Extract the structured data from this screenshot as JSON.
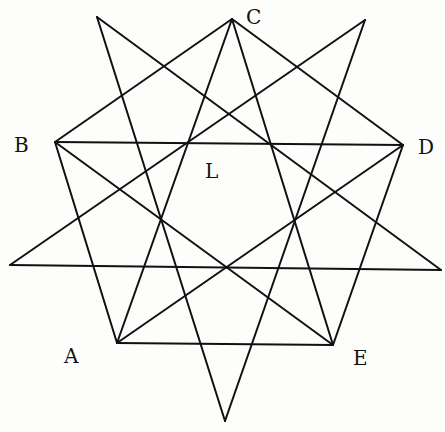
{
  "figure": {
    "labels": {
      "A": "A",
      "B": "B",
      "C": "C",
      "D": "D",
      "E": "E",
      "L": "L"
    },
    "pentagon_vertices": {
      "A": [
        117,
        343
      ],
      "B": [
        55,
        142
      ],
      "C": [
        232,
        19
      ],
      "D": [
        403,
        145
      ],
      "E": [
        333,
        345
      ]
    },
    "star_tips": {
      "top_left": [
        97,
        17
      ],
      "top_right": [
        365,
        20
      ],
      "right": [
        441,
        270
      ],
      "bottom": [
        225,
        421
      ],
      "left": [
        10,
        265
      ]
    },
    "pentagon_edges": [
      [
        "A",
        "B"
      ],
      [
        "B",
        "C"
      ],
      [
        "C",
        "D"
      ],
      [
        "D",
        "E"
      ],
      [
        "E",
        "A"
      ]
    ],
    "pentagon_diagonals": [
      [
        "A",
        "C"
      ],
      [
        "A",
        "D"
      ],
      [
        "B",
        "D"
      ],
      [
        "B",
        "E"
      ],
      [
        "C",
        "E"
      ]
    ],
    "star_edges": [
      [
        "top_left",
        "right"
      ],
      [
        "right",
        "left"
      ],
      [
        "left",
        "top_right"
      ],
      [
        "top_right",
        "bottom"
      ],
      [
        "bottom",
        "top_left"
      ]
    ]
  }
}
